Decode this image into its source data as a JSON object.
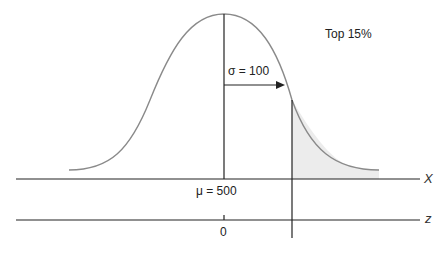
{
  "diagram": {
    "annotation_top": "Top 15%",
    "sigma_label": "σ = 100",
    "mu_label": "μ = 500",
    "x_axis_label": "X",
    "z_axis_label": "z",
    "z_tick_zero": "0",
    "colors": {
      "curve": "#8a8a8a",
      "shaded_region": "#ececec",
      "lines": "#222222"
    }
  }
}
